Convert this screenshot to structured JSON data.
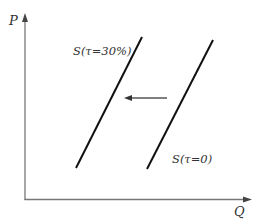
{
  "diagram": {
    "axes": {
      "y_label": "P",
      "x_label": "Q",
      "color": "#777777"
    },
    "curves": [
      {
        "id": "supply-with-tax",
        "label": "S(τ=30%)",
        "x1": 76,
        "y1": 168,
        "x2": 142,
        "y2": 37
      },
      {
        "id": "supply-no-tax",
        "label": "S(τ=0)",
        "x1": 147,
        "y1": 169,
        "x2": 213,
        "y2": 40
      }
    ],
    "shift_arrow": {
      "direction": "left",
      "from_x": 167,
      "to_x": 125,
      "y": 98,
      "color": "#555555"
    },
    "line_color": "#111111"
  }
}
